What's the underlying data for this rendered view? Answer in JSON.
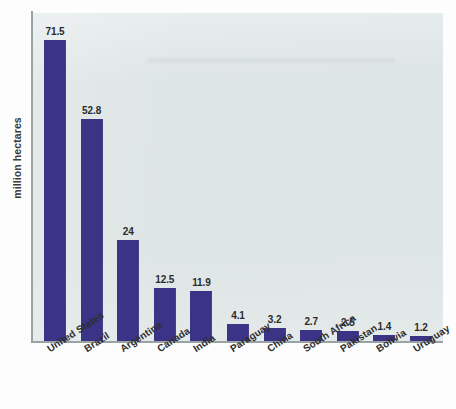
{
  "chart_data": {
    "type": "bar",
    "title": "",
    "subtitle": "",
    "xlabel": "",
    "ylabel": "million hectares",
    "ylim": [
      0,
      78
    ],
    "grid": false,
    "legend": null,
    "orientation": "vertical",
    "bar_color": "#3b3486",
    "plot_background": "#dee5e5",
    "categories": [
      "United States",
      "Brazil",
      "Argentina",
      "Canada",
      "India",
      "Paraguay",
      "China",
      "South Africa",
      "Pakistan",
      "Bolivia",
      "Uruguay"
    ],
    "values": [
      71.5,
      52.8,
      24,
      12.5,
      11.9,
      4.1,
      3.2,
      2.7,
      2.5,
      1.4,
      1.2
    ],
    "value_labels": [
      "71.5",
      "52.8",
      "24",
      "12.5",
      "11.9",
      "4.1",
      "3.2",
      "2.7",
      "2.5",
      "1.4",
      "1.2"
    ],
    "tick_labels": [
      "United States",
      "Brazil",
      "Argentina",
      "Canada",
      "India",
      "Paraguay",
      "China",
      "South Africa",
      "Pakistan",
      "Bolivia",
      "Uruguay"
    ]
  }
}
